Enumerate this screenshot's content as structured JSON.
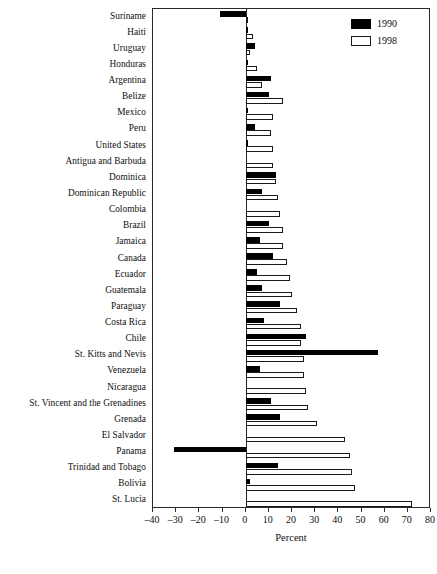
{
  "chart_data": {
    "type": "bar",
    "orientation": "horizontal",
    "title": "",
    "xlabel": "Percent",
    "ylabel": "",
    "xlim": [
      -40,
      80
    ],
    "xticks": [
      -40,
      -30,
      -20,
      -10,
      0,
      10,
      20,
      30,
      40,
      50,
      60,
      70,
      80
    ],
    "xtick_labels": [
      "–40",
      "–30",
      "–20",
      "–10",
      "0",
      "10",
      "20",
      "30",
      "40",
      "50",
      "60",
      "70",
      "80"
    ],
    "grid": false,
    "legend_position": "top-right",
    "categories": [
      "Suriname",
      "Haiti",
      "Uruguay",
      "Honduras",
      "Argentina",
      "Belize",
      "Mexico",
      "Peru",
      "United States",
      "Antigua and Barbuda",
      "Dominica",
      "Dominican Republic",
      "Colombia",
      "Brazil",
      "Jamaica",
      "Canada",
      "Ecuador",
      "Guatemala",
      "Paraguay",
      "Costa Rica",
      "Chile",
      "St. Kitts and Nevis",
      "Venezuela",
      "Nicaragua",
      "St. Vincent and the Grenadines",
      "Grenada",
      "El Salvador",
      "Panama",
      "Trinidad and Tobago",
      "Bolivia",
      "St. Lucia"
    ],
    "series": [
      {
        "name": "1990",
        "color": "#000000",
        "values": [
          -11,
          1,
          4,
          1,
          11,
          10,
          1,
          4,
          1,
          0,
          13,
          7,
          0,
          10,
          6,
          12,
          5,
          7,
          15,
          8,
          26,
          57,
          6,
          0,
          11,
          15,
          0,
          -31,
          14,
          2,
          0
        ]
      },
      {
        "name": "1998",
        "color": "#ffffff",
        "values": [
          1,
          3,
          2,
          5,
          7,
          16,
          12,
          11,
          12,
          12,
          13,
          14,
          15,
          16,
          16,
          18,
          19,
          20,
          22,
          24,
          24,
          25,
          25,
          26,
          27,
          31,
          43,
          45,
          46,
          47,
          72
        ]
      }
    ]
  },
  "legend": {
    "entries": [
      {
        "label": "1990",
        "swatch": "black-filled-square"
      },
      {
        "label": "1998",
        "swatch": "white-outlined-square"
      }
    ]
  }
}
